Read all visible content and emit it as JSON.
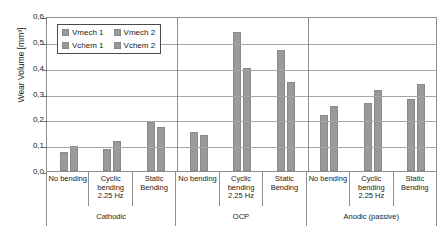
{
  "chart_data": {
    "type": "bar",
    "title": "",
    "xlabel": "",
    "ylabel": "Wear Volume [mm³]",
    "ylim": [
      0,
      0.6
    ],
    "ytick_labels": [
      "0,6",
      "0,5",
      "0,4",
      "0,3",
      "0,2",
      "0,1",
      "0,0"
    ],
    "ytick_values": [
      0.6,
      0.5,
      0.4,
      0.3,
      0.2,
      0.1,
      0.0
    ],
    "grid": true,
    "legend_position": "upper-left-inside",
    "legend": [
      "Vmech 1",
      "Vmech 2",
      "Vchem 1",
      "Vchem 2"
    ],
    "bar_color": "#9a9a9a",
    "groups": [
      {
        "name": "Cathodic",
        "categories": [
          "No bending",
          "Cyclic bending 2.25 Hz",
          "Static Bending"
        ],
        "series": [
          {
            "name": "set 1",
            "values": [
              0.075,
              0.085,
              0.19
            ]
          },
          {
            "name": "set 2",
            "values": [
              0.095,
              0.115,
              0.17
            ]
          }
        ]
      },
      {
        "name": "OCP",
        "categories": [
          "No bending",
          "Cyclic bending 2.25 Hz",
          "Static Bending"
        ],
        "series": [
          {
            "name": "set 1",
            "values": [
              0.15,
              0.54,
              0.47
            ]
          },
          {
            "name": "set 2",
            "values": [
              0.14,
              0.4,
              0.345
            ]
          }
        ]
      },
      {
        "name": "Anodic (passive)",
        "categories": [
          "No bending",
          "Cyclic bending 2.25 Hz",
          "Static Bending"
        ],
        "series": [
          {
            "name": "set 1",
            "values": [
              0.215,
              0.265,
              0.28
            ]
          },
          {
            "name": "set 2",
            "values": [
              0.25,
              0.315,
              0.335
            ]
          }
        ]
      }
    ]
  }
}
